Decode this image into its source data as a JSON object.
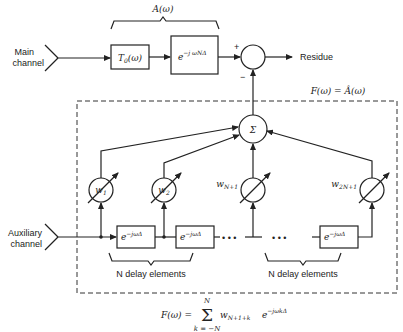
{
  "labels": {
    "main_channel_1": "Main",
    "main_channel_2": "channel",
    "aux_channel_1": "Auxiliary",
    "aux_channel_2": "channel",
    "residue": "Residue",
    "a_omega": "A(ω)",
    "f_omega": "F(ω) = Â(ω)",
    "plus": "+",
    "minus": "−",
    "sigma": "Σ",
    "t0": "T",
    "t0_sub": "0",
    "t0_arg": "(ω)",
    "delay_main": "e",
    "delay_main_exp": "−j ωNΔ",
    "delay_tap": "e",
    "delay_tap_exp": "−jωΔ",
    "w1": "w",
    "w1_sub": "1",
    "w2": "w",
    "w2_sub": "2",
    "wn1": "w",
    "wn1_sub": "N+1",
    "w2n1": "w",
    "w2n1_sub": "2N+1",
    "n_delay_left": "N delay elements",
    "n_delay_right": "N delay elements",
    "dots": "• • •"
  },
  "formula": {
    "lhs": "F(ω) =",
    "sum": "Σ",
    "upper": "N",
    "lower": "k = −N",
    "term": "w",
    "term_sub": "N+1+k",
    "exp_base": "e",
    "exp": "−jωkΔ"
  }
}
